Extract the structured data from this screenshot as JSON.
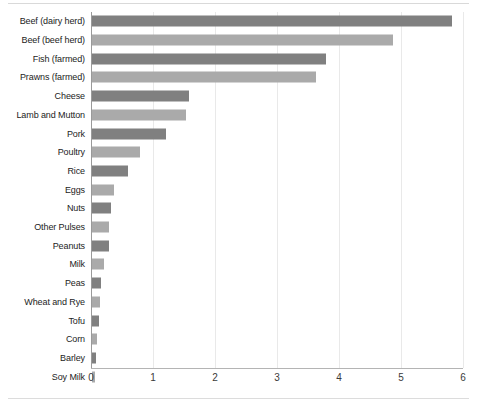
{
  "chart_data": {
    "type": "bar",
    "orientation": "horizontal",
    "title": "",
    "subtitle": "",
    "xlabel": "",
    "ylabel": "",
    "xlim": [
      0,
      6
    ],
    "ylim": null,
    "grid": true,
    "legend": null,
    "xticks": [
      "0",
      "1",
      "2",
      "3",
      "4",
      "5",
      "6"
    ],
    "xtick_values": [
      0,
      1,
      2,
      3,
      4,
      5,
      6
    ],
    "categories": [
      "Beef (dairy herd)",
      "Beef (beef herd)",
      "Fish (farmed)",
      "Prawns (farmed)",
      "Cheese",
      "Lamb and Mutton",
      "Pork",
      "Poultry",
      "Rice",
      "Eggs",
      "Nuts",
      "Other Pulses",
      "Peanuts",
      "Milk",
      "Peas",
      "Wheat and Rye",
      "Tofu",
      "Corn",
      "Barley",
      "Soy Milk"
    ],
    "values": [
      5.8,
      4.85,
      3.78,
      3.62,
      1.57,
      1.52,
      1.2,
      0.78,
      0.58,
      0.35,
      0.31,
      0.28,
      0.27,
      0.2,
      0.15,
      0.13,
      0.12,
      0.08,
      0.07,
      0.05
    ],
    "bar_colors": [
      "#808080",
      "#aaaaaa",
      "#808080",
      "#aaaaaa",
      "#808080",
      "#aaaaaa",
      "#808080",
      "#aaaaaa",
      "#808080",
      "#aaaaaa",
      "#808080",
      "#aaaaaa",
      "#808080",
      "#aaaaaa",
      "#808080",
      "#aaaaaa",
      "#808080",
      "#aaaaaa",
      "#808080",
      "#aaaaaa"
    ]
  },
  "colors": {
    "bar_dark": "#808080",
    "bar_light": "#aaaaaa",
    "gridline": "#e9e9e9",
    "axis": "#9a9a9a",
    "label_text": "#1c1c1c",
    "tick_text": "#3a3a3a",
    "background": "#ffffff"
  }
}
